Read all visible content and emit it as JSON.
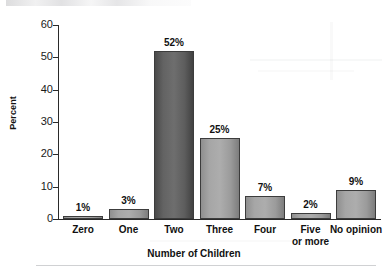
{
  "chart_data": {
    "type": "bar",
    "title": "",
    "xlabel": "Number of Children",
    "ylabel": "Percent",
    "categories": [
      "Zero",
      "One",
      "Two",
      "Three",
      "Four",
      "Five or more",
      "No opinion"
    ],
    "category_lines": [
      [
        "Zero"
      ],
      [
        "One"
      ],
      [
        "Two"
      ],
      [
        "Three"
      ],
      [
        "Four"
      ],
      [
        "Five",
        "or more"
      ],
      [
        "No opinion"
      ]
    ],
    "values": [
      1,
      3,
      52,
      25,
      7,
      2,
      9
    ],
    "value_labels": [
      "1%",
      "3%",
      "52%",
      "25%",
      "7%",
      "2%",
      "9%"
    ],
    "ylim": [
      0,
      60
    ],
    "yticks": [
      0,
      10,
      20,
      30,
      40,
      50,
      60
    ],
    "ytick_labels": [
      "0",
      "10",
      "20",
      "30",
      "40",
      "50",
      "60"
    ],
    "grid": false,
    "legend": "none",
    "bar_styles": [
      "mid",
      "mid",
      "dark",
      "mid",
      "mid",
      "mid",
      "mid"
    ],
    "colors": {
      "bar_dark": "#636363",
      "bar_light": "#a6a6a6",
      "bar_border": "#3c3c3c",
      "axis": "#2a2a2a",
      "text": "#111111",
      "background": "#ffffff"
    }
  }
}
